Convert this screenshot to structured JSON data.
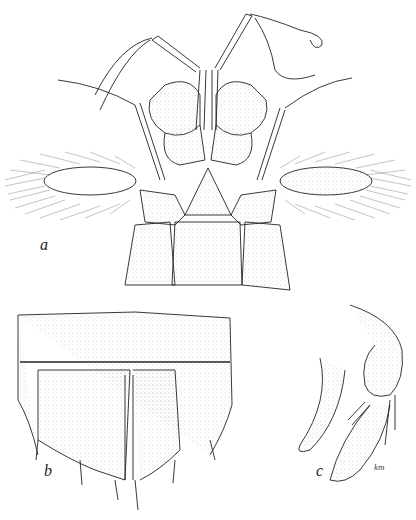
{
  "figure": {
    "panels": [
      {
        "label": "a",
        "subject": "anterior-cephalic-region-dorsal-view"
      },
      {
        "label": "b",
        "subject": "telson-dorsal-view"
      },
      {
        "label": "c",
        "subject": "uropod-lateral-view"
      }
    ],
    "artist_signature": "km",
    "colors": {
      "ink": "#222222",
      "paper": "#ffffff",
      "stipple": "#bbbbbb"
    }
  }
}
